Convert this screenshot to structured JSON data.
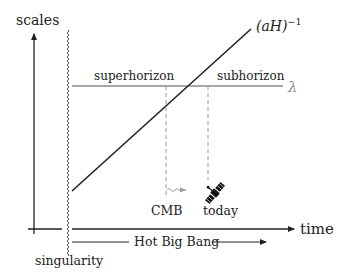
{
  "diagram": {
    "axes": {
      "y_label": "scales",
      "x_label": "time"
    },
    "singularity_label": "singularity",
    "hot_big_bang_label": "Hot Big Bang",
    "horizon_curve_label": {
      "base": "(aH)",
      "exponent": "−1"
    },
    "wavelength_label": "λ",
    "regions": {
      "left": "superhorizon",
      "right": "subhorizon"
    },
    "events": [
      {
        "label": "CMB",
        "icon": "wavy-arrow-icon"
      },
      {
        "label": "today",
        "icon": "satellite-icon"
      }
    ],
    "colors": {
      "ink": "#222222",
      "wavelength_line": "#8a8a8a",
      "dashed": "#9a9a9a"
    }
  }
}
